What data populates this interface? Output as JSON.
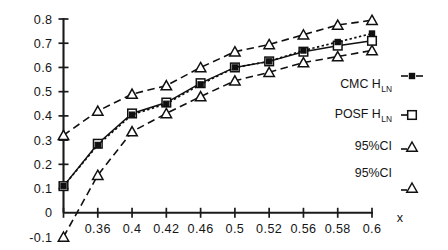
{
  "chart_data": {
    "type": "line",
    "title": "",
    "subtitle": "",
    "xlabel": "x",
    "ylabel": "",
    "xlim": [
      0.34,
      0.6
    ],
    "ylim": [
      -0.1,
      0.8
    ],
    "grid": false,
    "legend_position": "right",
    "x": [
      0.34,
      0.36,
      0.4,
      0.42,
      0.46,
      0.5,
      0.52,
      0.56,
      0.58,
      0.6
    ],
    "x_tick_labels": [
      "",
      "0.36",
      "0.4",
      "0.42",
      "0.46",
      "0.5",
      "0.52",
      "0.56",
      "0.58",
      "0.6"
    ],
    "y_tick_labels": [
      "0.8",
      "0.7",
      "0.6",
      "0.5",
      "0.4",
      "0.3",
      "0.2",
      "0.1",
      "0",
      "-0.1"
    ],
    "y_ticks": [
      0.8,
      0.7,
      0.6,
      0.5,
      0.4,
      0.3,
      0.2,
      0.1,
      0,
      -0.1
    ],
    "series": [
      {
        "name": "CMC H_LN",
        "legend_label": "CMC H",
        "legend_sub": "LN",
        "marker": "small-filled-square",
        "linestyle": "dotted",
        "values": [
          0.11,
          0.28,
          0.405,
          0.45,
          0.53,
          0.6,
          0.625,
          0.67,
          0.705,
          0.74
        ]
      },
      {
        "name": "POSF H_LN",
        "legend_label": "POSF H",
        "legend_sub": "LN",
        "marker": "open-square",
        "linestyle": "solid",
        "values": [
          0.11,
          0.285,
          0.41,
          0.455,
          0.535,
          0.6,
          0.625,
          0.665,
          0.69,
          0.71
        ]
      },
      {
        "name": "95%CI upper",
        "legend_label": "95%CI",
        "legend_sub": "",
        "marker": "open-triangle",
        "linestyle": "dashed",
        "values": [
          0.32,
          0.42,
          0.49,
          0.525,
          0.6,
          0.665,
          0.695,
          0.735,
          0.775,
          0.795
        ]
      },
      {
        "name": "95%CI lower",
        "legend_label": "95%CI",
        "legend_sub": "",
        "marker": "open-triangle",
        "linestyle": "dashed",
        "values": [
          -0.1,
          0.155,
          0.335,
          0.41,
          0.48,
          0.545,
          0.58,
          0.62,
          0.645,
          0.67
        ]
      }
    ]
  },
  "legend": {
    "items": [
      {
        "label": "CMC H",
        "sub": "LN",
        "key": "dotted-line-filled-square-marker"
      },
      {
        "label": "POSF H",
        "sub": "LN",
        "key": "open-square-marker"
      },
      {
        "label": "95%CI",
        "sub": "",
        "key": "open-triangle-marker"
      },
      {
        "label": "95%CI",
        "sub": "",
        "key": "open-triangle-marker"
      }
    ]
  },
  "axes": {
    "x_axis_title": "x"
  }
}
